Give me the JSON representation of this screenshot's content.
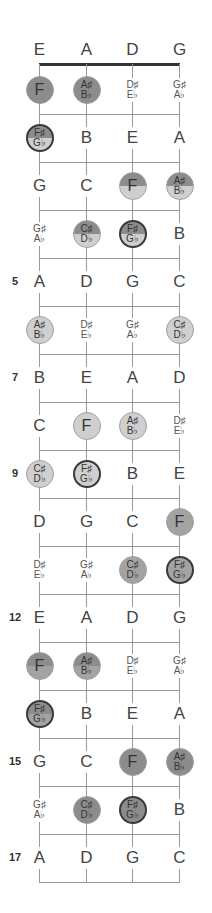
{
  "diagram": {
    "title_strings": [
      "E",
      "A",
      "D",
      "G"
    ],
    "string_x": [
      39,
      86,
      132,
      179
    ],
    "open_row_y": 50,
    "nut_y": 64,
    "first_row_y": 90,
    "row_pitch": 48,
    "colors": {
      "dark": "#8c8c8c",
      "medium": "#a3a3a3",
      "light": "#cfcfcf",
      "border_dark": "#3a3a3a",
      "line": "#999999"
    },
    "fret_numbers": [
      {
        "fret": 5,
        "label": "5"
      },
      {
        "fret": 7,
        "label": "7"
      },
      {
        "fret": 9,
        "label": "9"
      },
      {
        "fret": 12,
        "label": "12"
      },
      {
        "fret": 15,
        "label": "15"
      },
      {
        "fret": 17,
        "label": "17"
      }
    ],
    "rows": [
      {
        "fret": 0,
        "notes": [
          {
            "top": "E"
          },
          {
            "top": "A"
          },
          {
            "top": "D"
          },
          {
            "top": "G"
          }
        ]
      },
      {
        "fret": 1,
        "notes": [
          {
            "top": "F",
            "style": "dark"
          },
          {
            "top": "A♯",
            "bottom": "B♭",
            "style": "dark"
          },
          {
            "top": "D♯",
            "bottom": "E♭"
          },
          {
            "top": "G♯",
            "bottom": "A♭"
          }
        ]
      },
      {
        "fret": 2,
        "notes": [
          {
            "top": "F♯",
            "bottom": "G♭",
            "style": "split-dark",
            "ring": true
          },
          {
            "top": "B"
          },
          {
            "top": "E"
          },
          {
            "top": "A"
          }
        ]
      },
      {
        "fret": 3,
        "notes": [
          {
            "top": "G"
          },
          {
            "top": "C"
          },
          {
            "top": "F",
            "style": "split-dark"
          },
          {
            "top": "A♯",
            "bottom": "B♭",
            "style": "split-dark"
          }
        ]
      },
      {
        "fret": 4,
        "notes": [
          {
            "top": "G♯",
            "bottom": "A♭"
          },
          {
            "top": "C♯",
            "bottom": "D♭",
            "style": "split-dark"
          },
          {
            "top": "F♯",
            "bottom": "G♭",
            "style": "split-dark",
            "ring": true
          },
          {
            "top": "B"
          }
        ]
      },
      {
        "fret": 5,
        "notes": [
          {
            "top": "A"
          },
          {
            "top": "D"
          },
          {
            "top": "G"
          },
          {
            "top": "C"
          }
        ]
      },
      {
        "fret": 6,
        "notes": [
          {
            "top": "A♯",
            "bottom": "B♭",
            "style": "light"
          },
          {
            "top": "D♯",
            "bottom": "E♭"
          },
          {
            "top": "G♯",
            "bottom": "A♭"
          },
          {
            "top": "C♯",
            "bottom": "D♭",
            "style": "light"
          }
        ]
      },
      {
        "fret": 7,
        "notes": [
          {
            "top": "B"
          },
          {
            "top": "E"
          },
          {
            "top": "A"
          },
          {
            "top": "D"
          }
        ]
      },
      {
        "fret": 8,
        "notes": [
          {
            "top": "C"
          },
          {
            "top": "F",
            "style": "light"
          },
          {
            "top": "A♯",
            "bottom": "B♭",
            "style": "light"
          },
          {
            "top": "D♯",
            "bottom": "E♭"
          }
        ]
      },
      {
        "fret": 9,
        "notes": [
          {
            "top": "C♯",
            "bottom": "D♭",
            "style": "light"
          },
          {
            "top": "F♯",
            "bottom": "G♭",
            "style": "light",
            "ring": true
          },
          {
            "top": "B"
          },
          {
            "top": "E"
          }
        ]
      },
      {
        "fret": 10,
        "notes": [
          {
            "top": "D"
          },
          {
            "top": "G"
          },
          {
            "top": "C"
          },
          {
            "top": "F",
            "style": "medium"
          }
        ]
      },
      {
        "fret": 11,
        "notes": [
          {
            "top": "D♯",
            "bottom": "E♭"
          },
          {
            "top": "G♯",
            "bottom": "A♭"
          },
          {
            "top": "C♯",
            "bottom": "D♭",
            "style": "medium"
          },
          {
            "top": "F♯",
            "bottom": "G♭",
            "style": "medium",
            "ring": true
          }
        ]
      },
      {
        "fret": 12,
        "notes": [
          {
            "top": "E"
          },
          {
            "top": "A"
          },
          {
            "top": "D"
          },
          {
            "top": "G"
          }
        ]
      },
      {
        "fret": 13,
        "notes": [
          {
            "top": "F",
            "style": "split-medium"
          },
          {
            "top": "A♯",
            "bottom": "B♭",
            "style": "split-medium"
          },
          {
            "top": "D♯",
            "bottom": "E♭"
          },
          {
            "top": "G♯",
            "bottom": "A♭"
          }
        ]
      },
      {
        "fret": 14,
        "notes": [
          {
            "top": "F♯",
            "bottom": "G♭",
            "style": "split-medium",
            "ring": true
          },
          {
            "top": "B"
          },
          {
            "top": "E"
          },
          {
            "top": "A"
          }
        ]
      },
      {
        "fret": 15,
        "notes": [
          {
            "top": "G"
          },
          {
            "top": "C"
          },
          {
            "top": "F",
            "style": "dark"
          },
          {
            "top": "A♯",
            "bottom": "B♭",
            "style": "dark"
          }
        ]
      },
      {
        "fret": 16,
        "notes": [
          {
            "top": "G♯",
            "bottom": "A♭"
          },
          {
            "top": "C♯",
            "bottom": "D♭",
            "style": "dark"
          },
          {
            "top": "F♯",
            "bottom": "G♭",
            "style": "dark",
            "ring": true
          },
          {
            "top": "B"
          }
        ]
      },
      {
        "fret": 17,
        "notes": [
          {
            "top": "A"
          },
          {
            "top": "D"
          },
          {
            "top": "G"
          },
          {
            "top": "C"
          }
        ]
      }
    ]
  }
}
